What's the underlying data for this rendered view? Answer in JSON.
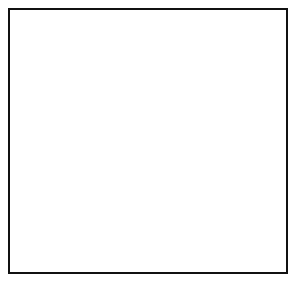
{
  "figure": {
    "kind": "globe-diagram",
    "projection": "orthographic",
    "frame_color": "#111111",
    "background_color": "#ffffff"
  },
  "colors": {
    "land": "#9b9b9b",
    "land_dark": "#8a8a8a",
    "ocean": "#ededed",
    "ocean_shadow": "#d8d8d8",
    "limb_shadow": "#b5b5b5",
    "outline": "#1a1a1a",
    "graticule": "#ffffff",
    "label": "#000000"
  },
  "globe": {
    "center_x": 149,
    "center_y": 146,
    "radius": 127
  },
  "continents": [
    {
      "name": "north-america",
      "label": "NORTH\nAMERICA",
      "x": 83,
      "y": 64
    },
    {
      "name": "south-america",
      "label": "SOUTH\nAMERICA",
      "x": 63,
      "y": 187
    },
    {
      "name": "europe",
      "label": "EUROPE",
      "x": 163,
      "y": 131
    },
    {
      "name": "africa",
      "label": "AFRICA",
      "x": 158,
      "y": 186
    },
    {
      "name": "asia",
      "label": "ASIA",
      "x": 211,
      "y": 115
    }
  ],
  "cities": [
    {
      "name": "new-york",
      "label": "New\nYork",
      "label_x": 79,
      "label_y": 110,
      "dot_x": 82,
      "dot_y": 102
    },
    {
      "name": "london",
      "label": "London",
      "label_x": 120,
      "label_y": 131,
      "dot_x": 136,
      "dot_y": 131
    }
  ],
  "poles": [
    {
      "name": "north-pole",
      "label": "North\nPole",
      "label_x": 151,
      "label_y": 76,
      "dot_x": 144,
      "dot_y": 89
    }
  ],
  "features": [
    {
      "name": "equator",
      "label": "Equator",
      "x": 72,
      "y": 172,
      "rotation": -18
    },
    {
      "name": "prime-meridian",
      "label": "Prime Meridian",
      "x": 131,
      "y": 200,
      "rotation": -90
    }
  ],
  "great_circle": {
    "name": "great-circle",
    "label_words": [
      "GREAT",
      "CIRCLE"
    ],
    "word1": {
      "text": "GREAT",
      "x": 203,
      "y": 168,
      "rotation": 48
    },
    "word2": {
      "text": "CIRCLE",
      "x": 228,
      "y": 206,
      "rotation": 48
    },
    "description": "great circle route drawn through New York and London"
  }
}
